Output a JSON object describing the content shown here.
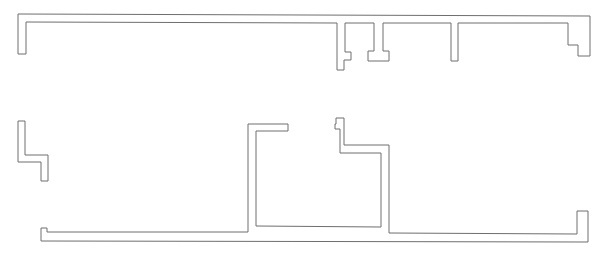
{
  "diagram": {
    "type": "floor-plan-wall-outline",
    "stroke_color": "#6e6e6e",
    "background": "#ffffff",
    "shapes": [
      {
        "name": "upper-wall-run",
        "points": "18,14 590,16 590,56 578,56 578,45 568,45 568,23 458,23 458,61 451,61 451,23 383,23 383,51 389,51 389,61 368,61 368,51 374,51 374,23 345,23 345,52 351,52 351,60 344,60 344,70 337,70 337,23 26,22 26,54 18,54"
      },
      {
        "name": "left-stepped-wall",
        "points": "18,121 25,121 25,155 48,155 48,181 41,181 41,162 18,162"
      },
      {
        "name": "lower-wall-run",
        "points": "41,228 47,228 47,232 248,232 248,124 288,124 288,131 256,131 256,226 381,227 381,153 340,153 340,129 335,129 335,124 336,124 336,118 344,118 344,145 389,145 389,233 577,234 577,211 588,211 588,242 41,241"
      }
    ]
  }
}
